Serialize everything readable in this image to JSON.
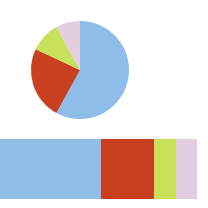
{
  "chart_data": [
    {
      "type": "pie",
      "title": "",
      "categories": [
        "Blue",
        "Red",
        "Green",
        "Pink"
      ],
      "values": [
        58,
        24,
        10,
        8
      ],
      "colors": [
        "#8dbde8",
        "#c8401f",
        "#c8e15a",
        "#e3cde0"
      ],
      "start_angle": "12 o'clock, clockwise",
      "legend": "none"
    },
    {
      "type": "bar",
      "orientation": "horizontal-stacked",
      "title": "",
      "categories": [
        "Blue",
        "Red",
        "Green",
        "Pink"
      ],
      "values": [
        52,
        27,
        11,
        11
      ],
      "colors": [
        "#8dbde8",
        "#c8401f",
        "#c8e15a",
        "#e3cde0"
      ],
      "legend": "none",
      "grid": false
    }
  ]
}
